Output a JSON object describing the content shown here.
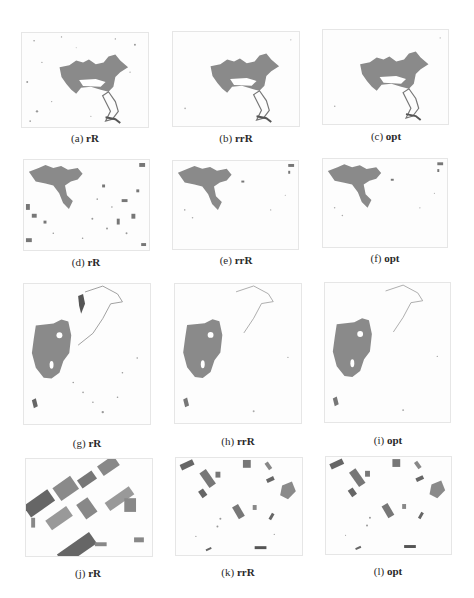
{
  "figure": {
    "panels": [
      {
        "id": "a",
        "letter": "(a)",
        "method": "rR",
        "scene": "lake",
        "noise": "medium"
      },
      {
        "id": "b",
        "letter": "(b)",
        "method": "rrR",
        "scene": "lake",
        "noise": "low"
      },
      {
        "id": "c",
        "letter": "(c)",
        "method": "opt",
        "scene": "lake",
        "noise": "low"
      },
      {
        "id": "d",
        "letter": "(d)",
        "method": "rR",
        "scene": "lake-crop",
        "noise": "high"
      },
      {
        "id": "e",
        "letter": "(e)",
        "method": "rrR",
        "scene": "lake-crop",
        "noise": "low"
      },
      {
        "id": "f",
        "letter": "(f)",
        "method": "opt",
        "scene": "lake-crop",
        "noise": "low"
      },
      {
        "id": "g",
        "letter": "(g)",
        "method": "rR",
        "scene": "island",
        "noise": "medium"
      },
      {
        "id": "h",
        "letter": "(h)",
        "method": "rrR",
        "scene": "island",
        "noise": "low"
      },
      {
        "id": "i",
        "letter": "(i)",
        "method": "opt",
        "scene": "island",
        "noise": "low"
      },
      {
        "id": "j",
        "letter": "(j)",
        "method": "rR",
        "scene": "fields",
        "noise": "high"
      },
      {
        "id": "k",
        "letter": "(k)",
        "method": "rrR",
        "scene": "fields",
        "noise": "low"
      },
      {
        "id": "l",
        "letter": "(l)",
        "method": "opt",
        "scene": "fields",
        "noise": "low"
      }
    ],
    "colors": {
      "region": "#8a8a8a",
      "dark": "#555555",
      "speck": "#9a9a9a",
      "background": "#ffffff"
    }
  }
}
